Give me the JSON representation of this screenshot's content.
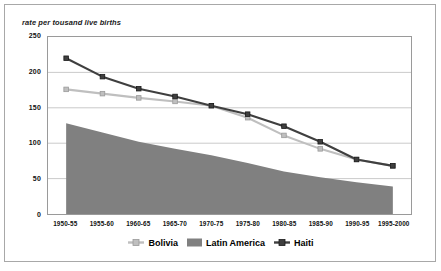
{
  "axis_title": "rate per tousand live births",
  "legend": [
    {
      "label": "Bolivia",
      "marker": "line-square-marker-icon",
      "color": "#bfbfbf"
    },
    {
      "label": "Latin America",
      "marker": "area-swatch-icon",
      "color": "#808080"
    },
    {
      "label": "Haiti",
      "marker": "line-square-marker-icon",
      "color": "#3f3f3f"
    }
  ],
  "chart_data": {
    "type": "line",
    "title": "",
    "subtitle": "",
    "xlabel": "",
    "ylabel": "rate per tousand live births",
    "ylim": [
      0,
      250
    ],
    "yticks": [
      0,
      50,
      100,
      150,
      200,
      250
    ],
    "grid": true,
    "legend_position": "bottom",
    "categories": [
      "1950-55",
      "1955-60",
      "1960-65",
      "1965-70",
      "1970-75",
      "1975-80",
      "1980-85",
      "1985-90",
      "1990-95",
      "1995-2000"
    ],
    "series": [
      {
        "name": "Bolivia",
        "type": "line",
        "color": "#bfbfbf",
        "marker": "square",
        "values": [
          176,
          170,
          164,
          159,
          153,
          136,
          111,
          92,
          77,
          68
        ]
      },
      {
        "name": "Latin America",
        "type": "area",
        "color": "#808080",
        "values": [
          128,
          115,
          102,
          92,
          83,
          72,
          60,
          52,
          45,
          39
        ]
      },
      {
        "name": "Haiti",
        "type": "line",
        "color": "#3f3f3f",
        "marker": "square",
        "values": [
          220,
          194,
          177,
          166,
          153,
          141,
          124,
          102,
          77,
          68
        ]
      }
    ]
  }
}
